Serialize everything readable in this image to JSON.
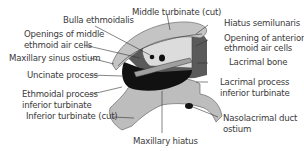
{
  "diagram": {
    "labels": {
      "bulla_ethmoidalis": "Bulla ethmoidalis",
      "middle_turbinate": "Middle turbinate (cut)",
      "hiatus_semilunaris": "Hiatus semilunaris",
      "openings_middle_1": "Openings of middle",
      "openings_middle_2": "ethmoid air cells",
      "opening_anterior_1": "Opening of anterior",
      "opening_anterior_2": "ethmoid air cells",
      "maxillary_sinus_ostium": "Maxillary sinus ostium",
      "lacrimal_bone": "Lacrimal bone",
      "uncinate_process": "Uncinate process",
      "lacrimal_process_1": "Lacrimal process",
      "lacrimal_process_2": "inferior turbinate",
      "ethmoidal_process_1": "Ethmoidal process",
      "ethmoidal_process_2": "inferior turbinate",
      "inferior_turbinate": "Inferior turbinate (cut)",
      "nasolacrimal_1": "Nasolacrimal duct",
      "nasolacrimal_2": "ostium",
      "maxillary_hiatus": "Maxillary hiatus"
    },
    "colors": {
      "bone_light": "#c8c8c8",
      "bone_mid": "#a8a8a8",
      "bone_dark": "#6a6a6a",
      "cavity": "#111111",
      "line": "#333333"
    }
  }
}
